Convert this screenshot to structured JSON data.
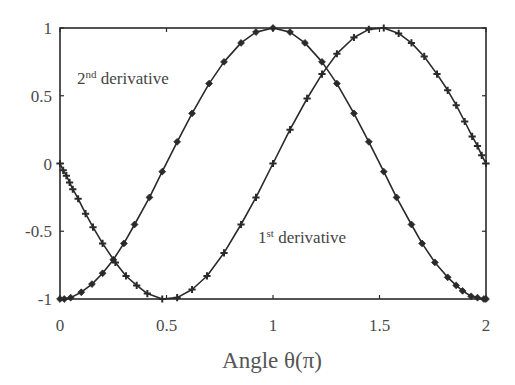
{
  "chart_data": {
    "type": "line",
    "title": "",
    "xlabel": "Angle θ(π)",
    "ylabel": "",
    "xlim": [
      0,
      2
    ],
    "ylim": [
      -1,
      1
    ],
    "xticks": [
      0,
      0.5,
      1,
      1.5,
      2
    ],
    "xtick_labels": [
      "0",
      "0.5",
      "1",
      "1.5",
      "2"
    ],
    "yticks": [
      1,
      0.5,
      0,
      -0.5,
      -1
    ],
    "ytick_labels": [
      "1",
      "0.5",
      "0",
      "-0.5",
      "-1"
    ],
    "grid": false,
    "legend": null,
    "line_color": "#2a2a2a",
    "series": [
      {
        "name": "2nd derivative",
        "marker": "diamond",
        "x": [
          0,
          0.02,
          0.05,
          0.1,
          0.15,
          0.2,
          0.25,
          0.3,
          0.35,
          0.42,
          0.48,
          0.55,
          0.62,
          0.7,
          0.77,
          0.85,
          0.92,
          1.0,
          1.08,
          1.15,
          1.23,
          1.3,
          1.38,
          1.45,
          1.52,
          1.58,
          1.65,
          1.7,
          1.76,
          1.82,
          1.86,
          1.89,
          1.93,
          1.96,
          1.99,
          2.0
        ],
        "y": [
          -1,
          -1.0,
          -0.99,
          -0.95,
          -0.89,
          -0.81,
          -0.71,
          -0.59,
          -0.45,
          -0.25,
          -0.06,
          0.16,
          0.37,
          0.59,
          0.75,
          0.89,
          0.97,
          1,
          0.97,
          0.89,
          0.75,
          0.59,
          0.37,
          0.16,
          -0.06,
          -0.25,
          -0.45,
          -0.59,
          -0.73,
          -0.84,
          -0.9,
          -0.94,
          -0.98,
          -0.99,
          -1.0,
          -1
        ]
      },
      {
        "name": "1st derivative",
        "marker": "plus",
        "x": [
          0,
          0.015,
          0.03,
          0.045,
          0.06,
          0.085,
          0.12,
          0.155,
          0.2,
          0.26,
          0.31,
          0.36,
          0.41,
          0.48,
          0.55,
          0.62,
          0.69,
          0.77,
          0.85,
          0.92,
          1.0,
          1.08,
          1.16,
          1.23,
          1.3,
          1.38,
          1.45,
          1.52,
          1.59,
          1.65,
          1.71,
          1.77,
          1.82,
          1.86,
          1.9,
          1.935,
          1.96,
          1.98,
          2.0
        ],
        "y": [
          0,
          -0.05,
          -0.09,
          -0.14,
          -0.19,
          -0.26,
          -0.37,
          -0.47,
          -0.59,
          -0.73,
          -0.83,
          -0.9,
          -0.96,
          -1.0,
          -0.99,
          -0.93,
          -0.83,
          -0.66,
          -0.45,
          -0.25,
          0,
          0.25,
          0.48,
          0.66,
          0.81,
          0.93,
          0.99,
          1.0,
          0.96,
          0.89,
          0.79,
          0.66,
          0.54,
          0.43,
          0.31,
          0.2,
          0.13,
          0.06,
          0
        ]
      }
    ],
    "annotations": [
      {
        "number": "2",
        "superscript": "nd",
        "text": " derivative",
        "x": 0.08,
        "y": 0.59
      },
      {
        "number": "1",
        "superscript": "st",
        "text": " derivative",
        "x": 0.93,
        "y": -0.59
      }
    ]
  }
}
